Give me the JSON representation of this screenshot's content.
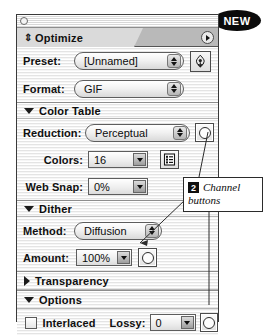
{
  "badge": {
    "label": "NEW"
  },
  "palette": {
    "tab_title": "Optimize",
    "grip_icon": "drag-grip-icon",
    "menu_icon": "palette-menu-arrow-icon",
    "close_icon": "close-box-icon"
  },
  "rows": {
    "preset": {
      "label": "Preset:",
      "value": "[Unnamed]",
      "save_icon": "droplet-save-icon"
    },
    "format": {
      "label": "Format:",
      "value": "GIF"
    },
    "reduction": {
      "label": "Reduction:",
      "value": "Perceptual",
      "channel_icon": "channel-mask-icon"
    },
    "colors": {
      "label": "Colors:",
      "value": "16",
      "list_icon": "color-table-list-icon"
    },
    "websnap": {
      "label": "Web Snap:",
      "value": "0%"
    },
    "method": {
      "label": "Method:",
      "value": "Diffusion"
    },
    "amount": {
      "label": "Amount:",
      "value": "100%",
      "channel_icon": "channel-mask-icon"
    },
    "interlaced": {
      "label": "Interlaced",
      "checked": false
    },
    "lossy": {
      "label": "Lossy:",
      "value": "0",
      "channel_icon": "channel-mask-icon"
    }
  },
  "sections": {
    "color_table": {
      "label": "Color Table",
      "expanded": true
    },
    "dither": {
      "label": "Dither",
      "expanded": true
    },
    "transparency": {
      "label": "Transparency",
      "expanded": false
    },
    "options": {
      "label": "Options",
      "expanded": true
    }
  },
  "callout": {
    "number": "2",
    "title": "Channel",
    "subtitle": "buttons"
  },
  "colors": {
    "ink": "#0d0d0d",
    "badge_bg": "#0b0b0b",
    "panel_border": "#3a3a3a",
    "tab_active": "#dadada",
    "tab_inactive": "#b9b9b9"
  }
}
